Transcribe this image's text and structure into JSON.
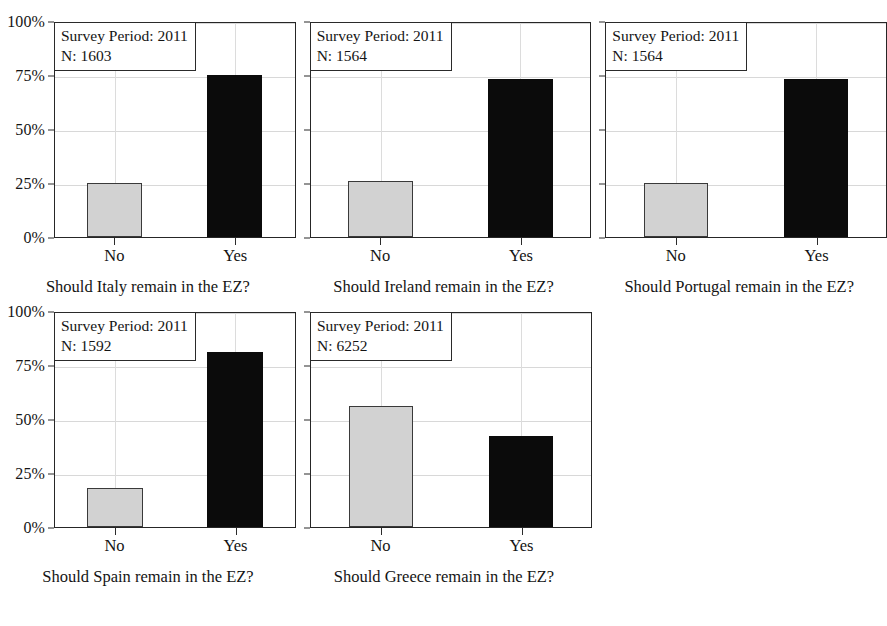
{
  "chart_data": {
    "type": "bar",
    "title": "",
    "subtitle": "",
    "xlabel": "",
    "ylabel": "",
    "ylim": [
      0,
      100
    ],
    "categories": [
      "No",
      "Yes"
    ],
    "ytick_labels": [
      "0%",
      "25%",
      "50%",
      "75%",
      "100%"
    ],
    "ytick_values": [
      0,
      25,
      50,
      75,
      100
    ],
    "grid": true,
    "legend": "none",
    "series_colors": {
      "No": "#d2d2d2",
      "Yes": "#0b0b0b"
    },
    "panels": [
      {
        "caption": "Should Italy remain in the EZ?",
        "annotation_period": "Survey Period: 2011",
        "annotation_n": "N: 1603",
        "survey_period": 2011,
        "n": 1603,
        "show_y_labels": true,
        "values": [
          25,
          75
        ]
      },
      {
        "caption": "Should Ireland remain in the EZ?",
        "annotation_period": "Survey Period: 2011",
        "annotation_n": "N: 1564",
        "survey_period": 2011,
        "n": 1564,
        "show_y_labels": false,
        "values": [
          26,
          73
        ]
      },
      {
        "caption": "Should Portugal remain in the EZ?",
        "annotation_period": "Survey Period: 2011",
        "annotation_n": "N: 1564",
        "survey_period": 2011,
        "n": 1564,
        "show_y_labels": false,
        "values": [
          25,
          73
        ]
      },
      {
        "caption": "Should Spain remain in the EZ?",
        "annotation_period": "Survey Period: 2011",
        "annotation_n": "N: 1592",
        "survey_period": 2011,
        "n": 1592,
        "show_y_labels": true,
        "values": [
          18,
          81
        ]
      },
      {
        "caption": "Should Greece remain in the EZ?",
        "annotation_period": "Survey Period: 2011",
        "annotation_n": "N: 6252",
        "survey_period": 2011,
        "n": 6252,
        "show_y_labels": false,
        "values": [
          56,
          42
        ]
      }
    ]
  },
  "layout": {
    "rows": [
      [
        0,
        1,
        2
      ],
      [
        3,
        4
      ]
    ],
    "panel_width": 296,
    "plot_height": 216,
    "row_top_offsets": [
      22,
      320
    ]
  }
}
